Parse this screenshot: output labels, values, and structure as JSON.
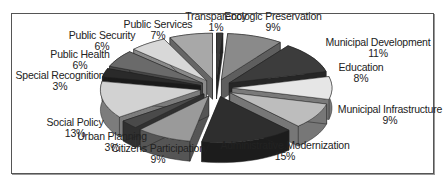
{
  "chart_data": {
    "type": "pie",
    "style": "3d-exploded",
    "title": "",
    "start_angle_deg": 0,
    "direction": "clockwise",
    "slices": [
      {
        "label": "Transparency",
        "value": 1,
        "pct_label": "1%",
        "color": "#3a3a3a",
        "side": "#222222"
      },
      {
        "label": "Ecologic Preservation",
        "value": 9,
        "pct_label": "9%",
        "color": "#8a8a8a",
        "side": "#5e5e5e"
      },
      {
        "label": "Municipal Development",
        "value": 11,
        "pct_label": "11%",
        "color": "#3c3c3c",
        "side": "#262626"
      },
      {
        "label": "Education",
        "value": 8,
        "pct_label": "8%",
        "color": "#e6e6e6",
        "side": "#7a7a7a"
      },
      {
        "label": "Municipal Infrastructure",
        "value": 9,
        "pct_label": "9%",
        "color": "#bdbdbd",
        "side": "#777777"
      },
      {
        "label": "Administrative Modernization",
        "value": 15,
        "pct_label": "15%",
        "color": "#2e2e2e",
        "side": "#1c1c1c"
      },
      {
        "label": "Citizens Participation",
        "value": 9,
        "pct_label": "9%",
        "color": "#9a9a9a",
        "side": "#555555"
      },
      {
        "label": "Urban Planning",
        "value": 3,
        "pct_label": "3%",
        "color": "#4a4a4a",
        "side": "#303030"
      },
      {
        "label": "Social Policy",
        "value": 13,
        "pct_label": "13%",
        "color": "#d2d2d2",
        "side": "#7c7c7c"
      },
      {
        "label": "Special Recognition",
        "value": 3,
        "pct_label": "3%",
        "color": "#2a2a2a",
        "side": "#1a1a1a"
      },
      {
        "label": "Public Health",
        "value": 6,
        "pct_label": "6%",
        "color": "#6a6a6a",
        "side": "#474747"
      },
      {
        "label": "Public Security",
        "value": 6,
        "pct_label": "6%",
        "color": "#d8d8d8",
        "side": "#8a8a8a"
      },
      {
        "label": "Public Services",
        "value": 7,
        "pct_label": "7%",
        "color": "#a8a8a8",
        "side": "#666666"
      }
    ],
    "legend": "none (labels placed around pie)",
    "label_positions": [
      {
        "x": 216,
        "y": 11
      },
      {
        "x": 273,
        "y": 11
      },
      {
        "x": 378,
        "y": 37
      },
      {
        "x": 361,
        "y": 62
      },
      {
        "x": 390,
        "y": 104
      },
      {
        "x": 285,
        "y": 140
      },
      {
        "x": 158,
        "y": 143
      },
      {
        "x": 112,
        "y": 131
      },
      {
        "x": 75,
        "y": 117
      },
      {
        "x": 60,
        "y": 70
      },
      {
        "x": 80,
        "y": 49
      },
      {
        "x": 102,
        "y": 30
      },
      {
        "x": 158,
        "y": 19
      }
    ]
  }
}
